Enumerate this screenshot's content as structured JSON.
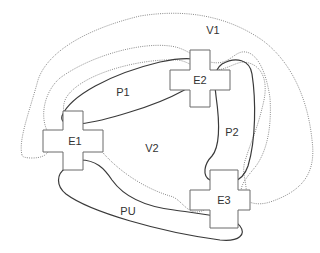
{
  "diagram": {
    "type": "region-connection-diagram",
    "regions": [
      {
        "id": "V1",
        "label": "V1",
        "style": "dotted",
        "x": 213,
        "y": 30
      },
      {
        "id": "V2",
        "label": "V2",
        "style": "dotted",
        "x": 152,
        "y": 148
      }
    ],
    "paths": [
      {
        "id": "P1",
        "label": "P1",
        "style": "solid",
        "x": 123,
        "y": 92
      },
      {
        "id": "P2",
        "label": "P2",
        "style": "solid",
        "x": 232,
        "y": 132
      },
      {
        "id": "PU",
        "label": "PU",
        "style": "solid",
        "x": 123,
        "y": 211
      }
    ],
    "endpoints": [
      {
        "id": "E1",
        "label": "E1",
        "shape": "cross",
        "x": 73,
        "y": 144
      },
      {
        "id": "E2",
        "label": "E2",
        "shape": "cross",
        "x": 200,
        "y": 82
      },
      {
        "id": "E3",
        "label": "E3",
        "shape": "cross",
        "x": 225,
        "y": 203
      }
    ],
    "colors": {
      "dotted_stroke": "#8a8a8a",
      "solid_stroke": "#3a3a3a",
      "cross_stroke": "#6a6a6a",
      "text": "#333333",
      "background": "#ffffff"
    }
  }
}
